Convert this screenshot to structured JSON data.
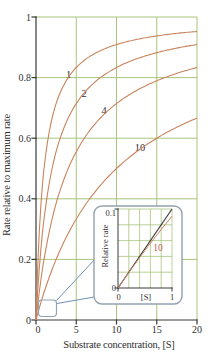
{
  "figure": {
    "background": "#ffffff",
    "colors": {
      "curve": "#c9845c",
      "grid": "#a9c47d",
      "axis": "#3a3a3a",
      "text": "#2f2f2f",
      "connector_blue": "#7292b4",
      "inset_border": "#94a1ae",
      "inset_line_dark": "#3c3c3c",
      "inset_curve_label": "#c05b47"
    }
  },
  "main_chart": {
    "xlabel": "Substrate concentration, [S]",
    "ylabel": "Rate relative to maximum rate",
    "x_ticks": [
      "0",
      "5",
      "10",
      "15",
      "20"
    ],
    "y_ticks": [
      "0",
      "0.2",
      "0.4",
      "0.6",
      "0.8",
      "1"
    ]
  },
  "inset": {
    "xlabel": "[S]",
    "ylabel": "Relative rate",
    "x_ticks": [
      "0",
      "1"
    ],
    "y_ticks": [
      "0",
      "0.1"
    ],
    "curve_label": "10"
  },
  "chart_data": {
    "type": "line",
    "title": "",
    "xlabel": "Substrate concentration, [S]",
    "ylabel": "Rate relative to maximum rate",
    "xlim": [
      0,
      20
    ],
    "ylim": [
      0,
      1
    ],
    "grid": true,
    "legend": "none",
    "x_gridlines": [
      5,
      10,
      15,
      20
    ],
    "y_gridlines": [
      0.2,
      0.4,
      0.6,
      0.8,
      1.0
    ],
    "model": "rate = [S] / (Km + [S])",
    "x_samples": [
      0,
      1,
      2,
      4,
      6,
      10,
      15,
      20
    ],
    "series": [
      {
        "label": "1",
        "km": 1,
        "values": [
          0,
          0.5,
          0.667,
          0.8,
          0.857,
          0.909,
          0.938,
          0.952
        ]
      },
      {
        "label": "2",
        "km": 2,
        "values": [
          0,
          0.333,
          0.5,
          0.667,
          0.75,
          0.833,
          0.882,
          0.909
        ]
      },
      {
        "label": "4",
        "km": 4,
        "values": [
          0,
          0.2,
          0.333,
          0.5,
          0.6,
          0.714,
          0.789,
          0.833
        ]
      },
      {
        "label": "10",
        "km": 10,
        "values": [
          0,
          0.091,
          0.167,
          0.286,
          0.375,
          0.5,
          0.6,
          0.667
        ]
      }
    ],
    "inset": {
      "xlabel": "[S]",
      "ylabel": "Relative rate",
      "xlim": [
        0,
        1
      ],
      "ylim": [
        0,
        0.1
      ],
      "x_gridlines": [
        0.2,
        0.4,
        0.6,
        0.8,
        1.0
      ],
      "y_gridlines": [
        0.02,
        0.04,
        0.06,
        0.08,
        0.1
      ],
      "lines": [
        {
          "type": "straight",
          "from": [
            0,
            0
          ],
          "to": [
            1,
            0.1
          ]
        },
        {
          "type": "curve",
          "label": "10",
          "km": 10,
          "value_at_1": 0.0909
        }
      ]
    }
  }
}
